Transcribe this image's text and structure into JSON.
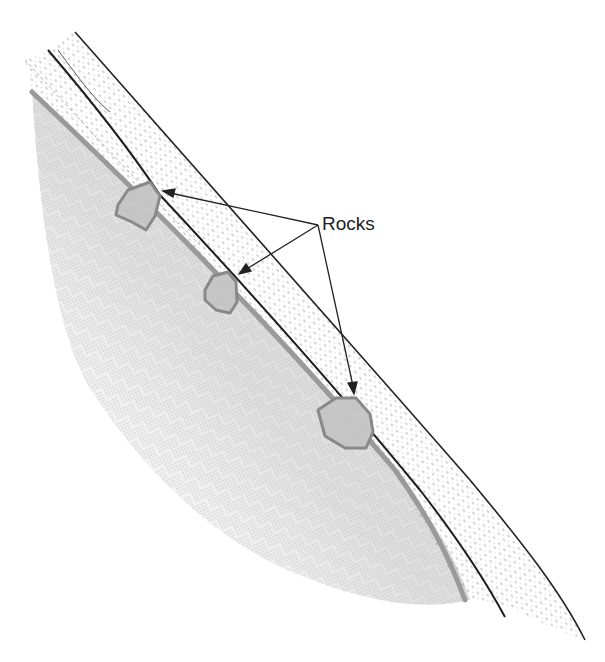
{
  "diagram": {
    "type": "geologic-cross-section",
    "annotation": {
      "label": "Rocks",
      "arrow_count": 3,
      "targets": [
        "upper-rock",
        "middle-rock",
        "lower-rock"
      ]
    },
    "layers": [
      {
        "name": "bedrock",
        "pattern": "basketweave-hatch",
        "color": "#d8d8d8"
      },
      {
        "name": "lower-soil-layer",
        "pattern": "dashed-strata"
      },
      {
        "name": "middle-soil-layer",
        "pattern": "dashed-strata"
      },
      {
        "name": "upper-soil-layer",
        "pattern": "dashed-strata"
      }
    ],
    "colors": {
      "rock_fill": "#c4c4c4",
      "rock_outline": "#8a8a8a",
      "boundary": "#9a9a9a",
      "line": "#222222",
      "hatch": "#9c9c9c"
    }
  }
}
